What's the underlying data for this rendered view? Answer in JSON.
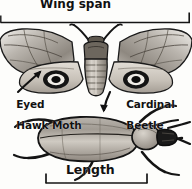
{
  "figure": {
    "kind": "insect-measurement-diagram",
    "background_color": "#fdfdfb",
    "ink_color": "#111111"
  },
  "measurements": {
    "wing_span": {
      "label": "Wing span",
      "bracket": "horizontal-span-bracket",
      "applies_to": "Eyed Hawk Moth",
      "position": "top"
    },
    "length": {
      "label": "Length",
      "bracket": "horizontal-span-bracket",
      "applies_to": "Cardinal Beetle",
      "position": "bottom"
    }
  },
  "specimens": [
    {
      "id": "moth",
      "name_line1": "Eyed",
      "name_line2": "Hawk Moth",
      "common_name": "Eyed Hawk Moth",
      "pointer": "arrow-up-right",
      "features": [
        "eyespot-left-hindwing",
        "eyespot-right-hindwing",
        "segmented-abdomen",
        "paired-antennae"
      ]
    },
    {
      "id": "beetle",
      "name_line1": "Cardinal",
      "name_line2": "Beetle",
      "common_name": "Cardinal Beetle",
      "pointer": "arrow-down",
      "features": [
        "oval-elytra",
        "elytral-seam",
        "six-legs",
        "dark-head",
        "antennae"
      ]
    }
  ]
}
